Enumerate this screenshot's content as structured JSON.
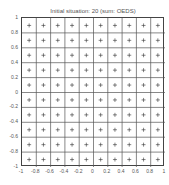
{
  "chart_data": {
    "type": "scatter",
    "title": "Initial situation: 20 (sum: OEDS)",
    "xlabel": "",
    "ylabel": "",
    "xlim": [
      -1,
      1
    ],
    "ylim": [
      -1,
      1
    ],
    "grid": true,
    "grid_spacing": 0.2,
    "marker": "+",
    "x_ticks": [
      "-1",
      "-0.8",
      "-0.6",
      "-0.4",
      "-0.2",
      "0",
      "0.2",
      "0.4",
      "0.6",
      "0.8",
      "1"
    ],
    "y_ticks": [
      "1",
      "0.8",
      "0.6",
      "0.4",
      "0.2",
      "0",
      "-0.2",
      "-0.4",
      "-0.6",
      "-0.8",
      "-1"
    ],
    "point_coords_x": [
      -0.9,
      -0.7,
      -0.5,
      -0.3,
      -0.1,
      0.1,
      0.3,
      0.5,
      0.7,
      0.9
    ],
    "point_coords_y": [
      -0.9,
      -0.7,
      -0.5,
      -0.3,
      -0.1,
      0.1,
      0.3,
      0.5,
      0.7,
      0.9
    ],
    "points_description": "100 points on a regular 10x10 lattice at cell centers"
  },
  "colors": {
    "axis": "#444444",
    "grid": "#555555",
    "marker": "#333333",
    "text": "#555555"
  }
}
